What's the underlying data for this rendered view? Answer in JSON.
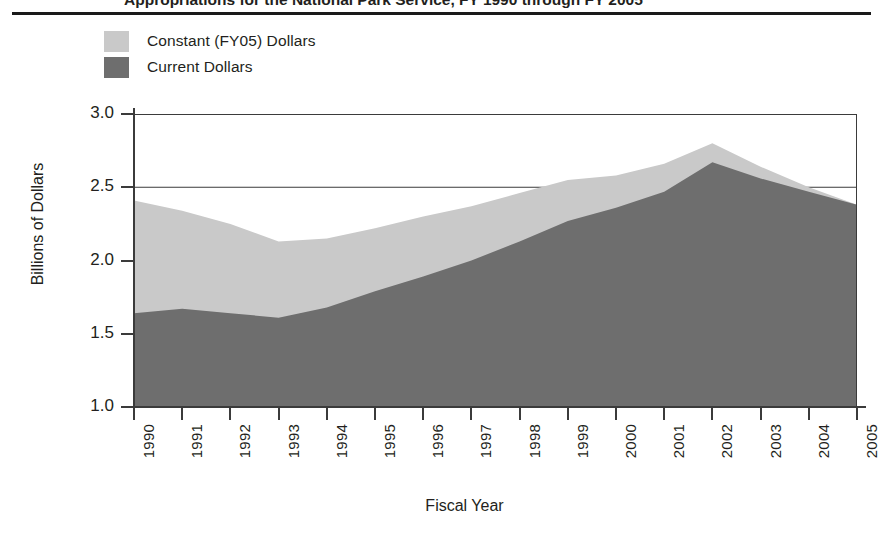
{
  "figure": {
    "cutoff_title": "Appropriations for the National Park Service, FY 1990 through FY 2005",
    "background_color": "#ffffff"
  },
  "legend": {
    "position": "top-left",
    "items": [
      {
        "label": "Constant (FY05) Dollars",
        "color": "#c9c9c9",
        "swatch_name": "legend-swatch-constant"
      },
      {
        "label": "Current Dollars",
        "color": "#6e6e6e",
        "swatch_name": "legend-swatch-current"
      }
    ]
  },
  "axes": {
    "y_title": "Billions of Dollars",
    "x_title": "Fiscal Year",
    "y_ticks": [
      "3.0",
      "2.5",
      "2.0",
      "1.5",
      "1.0"
    ],
    "x_ticks": [
      "1990",
      "1991",
      "1992",
      "1993",
      "1994",
      "1995",
      "1996",
      "1997",
      "1998",
      "1999",
      "2000",
      "2001",
      "2002",
      "2003",
      "2004",
      "2005"
    ]
  },
  "chart_data": {
    "type": "area",
    "title": "Appropriations for the National Park Service, FY 1990 through FY 2005",
    "xlabel": "Fiscal Year",
    "ylabel": "Billions of Dollars",
    "xlim": [
      1990,
      2005
    ],
    "ylim": [
      1.0,
      3.0
    ],
    "ytick_interval": 0.5,
    "grid": true,
    "grid_axis": "y",
    "stacked": false,
    "legend_position": "top-left",
    "x": [
      1990,
      1991,
      1992,
      1993,
      1994,
      1995,
      1996,
      1997,
      1998,
      1999,
      2000,
      2001,
      2002,
      2003,
      2004,
      2005
    ],
    "categories": [
      "1990",
      "1991",
      "1992",
      "1993",
      "1994",
      "1995",
      "1996",
      "1997",
      "1998",
      "1999",
      "2000",
      "2001",
      "2002",
      "2003",
      "2004",
      "2005"
    ],
    "series": [
      {
        "name": "Constant (FY05) Dollars",
        "color": "#c9c9c9",
        "values": [
          2.41,
          2.34,
          2.25,
          2.13,
          2.15,
          2.22,
          2.3,
          2.37,
          2.46,
          2.55,
          2.58,
          2.66,
          2.8,
          2.64,
          2.5,
          2.38
        ]
      },
      {
        "name": "Current Dollars",
        "color": "#6e6e6e",
        "values": [
          1.64,
          1.67,
          1.64,
          1.61,
          1.68,
          1.79,
          1.89,
          2.0,
          2.13,
          2.27,
          2.36,
          2.47,
          2.67,
          2.56,
          2.47,
          2.38
        ]
      }
    ]
  }
}
